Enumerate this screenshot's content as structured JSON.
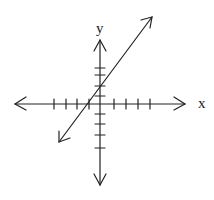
{
  "diagram": {
    "type": "coordinate-plane-with-line",
    "axes": {
      "x_label": "x",
      "y_label": "y",
      "x_ticks_left": 4,
      "x_ticks_right": 4,
      "y_ticks_up": 4,
      "y_ticks_down": 4
    },
    "line": {
      "description": "straight line with positive slope, arrows on both ends",
      "approx_x_intercept": -1,
      "approx_y_intercept": 1.5
    },
    "colors": {
      "stroke": "#222222",
      "background": "#ffffff"
    }
  }
}
